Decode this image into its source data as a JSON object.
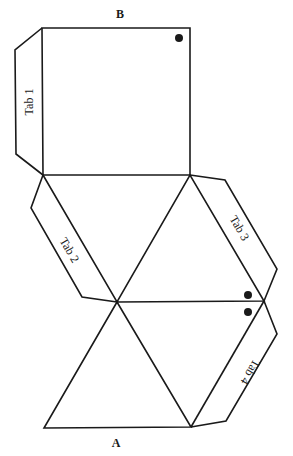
{
  "diagram": {
    "type": "net",
    "labels": {
      "top_edge": "B",
      "bottom_edge": "A"
    },
    "tabs": [
      {
        "label": "Tab 1"
      },
      {
        "label": "Tab 2"
      },
      {
        "label": "Tab 3"
      },
      {
        "label": "Tab 4"
      }
    ],
    "markers": [
      "dot-square-corner",
      "dot-upper-triangle-tip",
      "dot-lower-triangle-tip"
    ],
    "colors": {
      "stroke": "#1a1a1a",
      "background": "#ffffff"
    }
  }
}
